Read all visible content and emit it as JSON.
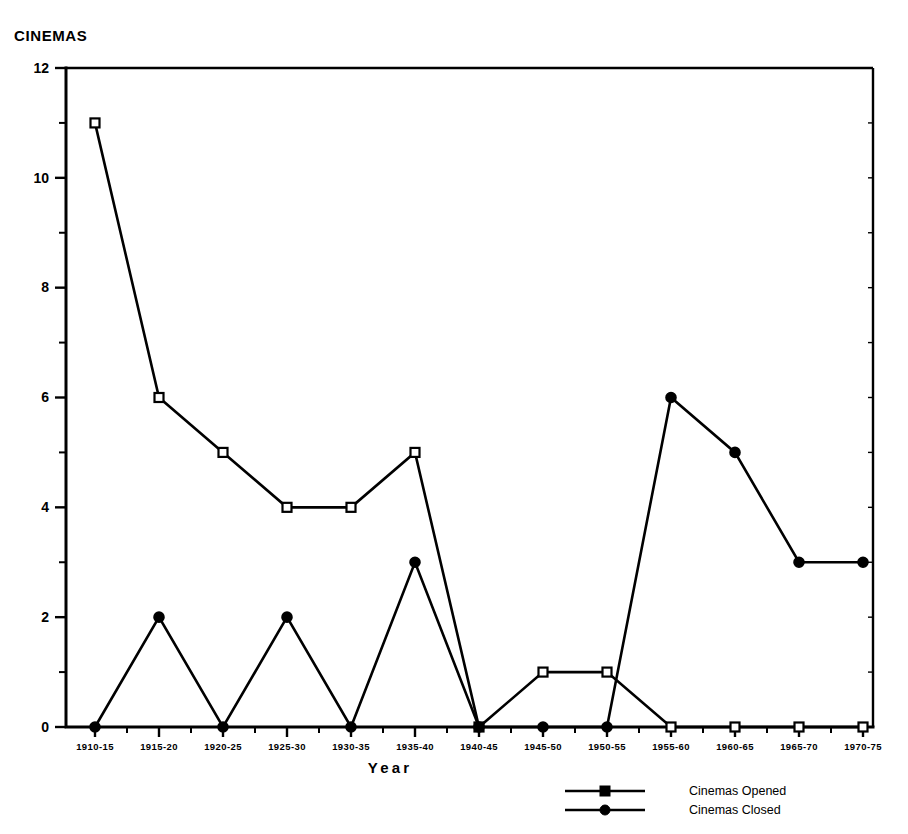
{
  "chart_data": {
    "type": "line",
    "title": "CINEMAS",
    "xlabel": "Year",
    "ylabel": "",
    "ylim": [
      0,
      12
    ],
    "y_ticks": [
      0,
      2,
      4,
      6,
      8,
      10,
      12
    ],
    "y_minor_ticks": [
      1,
      3,
      5,
      7,
      9,
      11
    ],
    "grid": false,
    "legend_position": "bottom-right",
    "categories": [
      "1910-15",
      "1915-20",
      "1920-25",
      "1925-30",
      "1930-35",
      "1935-40",
      "1940-45",
      "1945-50",
      "1950-55",
      "1955-60",
      "1960-65",
      "1965-70",
      "1970-75"
    ],
    "series": [
      {
        "name": "Cinemas Opened",
        "marker": "square-open",
        "values": [
          11,
          6,
          5,
          4,
          4,
          5,
          0,
          1,
          1,
          0,
          0,
          0,
          0
        ]
      },
      {
        "name": "Cinemas Closed",
        "marker": "circle-filled",
        "values": [
          0,
          2,
          0,
          2,
          0,
          3,
          0,
          0,
          0,
          6,
          5,
          3,
          3
        ]
      }
    ]
  },
  "legend": {
    "items": [
      {
        "label": "Cinemas Opened",
        "marker": "square-open"
      },
      {
        "label": "Cinemas Closed",
        "marker": "circle-filled"
      }
    ]
  },
  "colors": {
    "ink": "#000000",
    "background": "#ffffff"
  }
}
